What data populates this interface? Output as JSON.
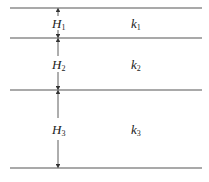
{
  "diagram": {
    "boundaries_y": [
      8,
      38,
      90,
      168
    ],
    "line_x": [
      10,
      202
    ],
    "arrow_x": 58,
    "colors": {
      "line": "#555555",
      "text": "#222222"
    },
    "layers": [
      {
        "thickness_label": "H",
        "thickness_sub": "1",
        "perm_label": "k",
        "perm_sub": "1"
      },
      {
        "thickness_label": "H",
        "thickness_sub": "2",
        "perm_label": "k",
        "perm_sub": "2"
      },
      {
        "thickness_label": "H",
        "thickness_sub": "3",
        "perm_label": "k",
        "perm_sub": "3"
      }
    ]
  }
}
